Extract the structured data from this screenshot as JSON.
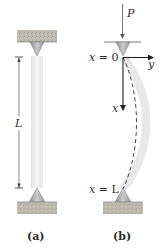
{
  "figure_a": {
    "caption": "(a)",
    "length_label": "L"
  },
  "figure_b": {
    "caption": "(b)",
    "load_label": "P",
    "top_position_label_var": "x",
    "top_position_label_eq": " = 0",
    "bottom_position_label_var": "x",
    "bottom_position_label_eq": " = L",
    "x_axis_label": "x",
    "y_axis_label": "y"
  },
  "colors": {
    "support_block": "#b9b7b1",
    "support_pin": "#a9a9a9",
    "column": "#efefef",
    "column_bent": "#e7e7e7",
    "line": "#3a3a3a",
    "axis": "#222222"
  }
}
